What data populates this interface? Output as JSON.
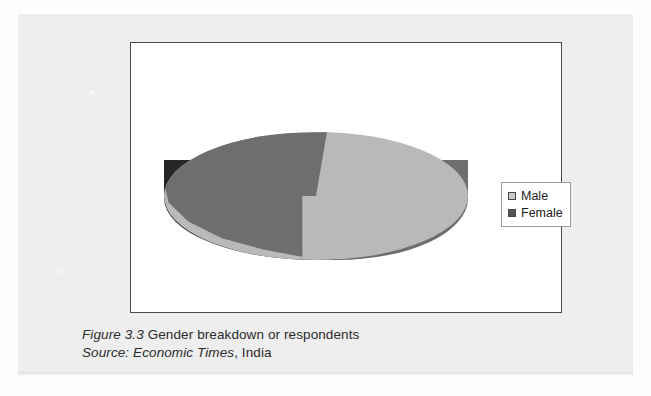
{
  "figure": {
    "caption_label": "Figure 3.3",
    "caption_title": "Gender breakdown or respondents",
    "source_label": "Source:",
    "source_publication": "Economic Times",
    "source_region": ", India"
  },
  "legend": {
    "position": "right",
    "items": [
      {
        "label": "Male",
        "swatch_color": "#c9c9c9"
      },
      {
        "label": "Female",
        "swatch_color": "#555555"
      }
    ]
  },
  "colors": {
    "male_top": "#b9b9b9",
    "female_top": "#6e6e6e",
    "male_wall": "#6e6e6e",
    "female_wall": "#262626",
    "frame_border": "#4a4a4a",
    "page_background": "#eeeeee",
    "plot_background": "#ffffff"
  },
  "chart_data": {
    "type": "pie",
    "title": "",
    "subtitle": "",
    "xlabel": "",
    "ylabel": "",
    "three_d": true,
    "start_angle_deg": 0,
    "direction": "clockwise",
    "grid": false,
    "legend_position": "right",
    "categories": [
      "Male",
      "Female"
    ],
    "values": [
      42,
      58
    ],
    "unit": "%",
    "data_labels_shown": false,
    "slices": [
      {
        "name": "Male",
        "value": 42,
        "color": "#b9b9b9",
        "start_deg": 0,
        "end_deg": 151
      },
      {
        "name": "Female",
        "value": 58,
        "color": "#6e6e6e",
        "start_deg": 151,
        "end_deg": 360
      }
    ],
    "annotations": []
  }
}
